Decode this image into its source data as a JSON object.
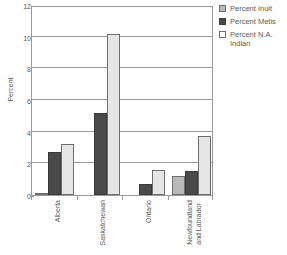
{
  "chart_data": {
    "type": "bar",
    "title": "",
    "xlabel": "",
    "ylabel": "Percent",
    "ylim": [
      0,
      12
    ],
    "yticks": [
      0,
      2,
      4,
      6,
      8,
      10,
      12
    ],
    "ytick_labels": [
      "0",
      "2",
      "4",
      "6",
      "8",
      "10",
      "12"
    ],
    "grid": true,
    "legend_position": "right",
    "categories": [
      "Alberta",
      "Saskatchewan",
      "Ontario",
      "Newfoundland and Labrador"
    ],
    "category_lines": [
      [
        "Alberta"
      ],
      [
        "Saskatchewan"
      ],
      [
        "Ontario"
      ],
      [
        "Newfoundland",
        "and Labrador"
      ]
    ],
    "series": [
      {
        "name": "Percent Inuit",
        "color": "#b9b9b9",
        "values": [
          0.05,
          0,
          0,
          1.2
        ]
      },
      {
        "name": "Percent Metis",
        "color": "#4a4a4a",
        "values": [
          2.7,
          5.2,
          0.7,
          1.5
        ]
      },
      {
        "name": "Percent N.A. Indian",
        "color": "#e6e6e6",
        "values": [
          3.25,
          10.2,
          1.55,
          3.75
        ]
      }
    ]
  },
  "legend": {
    "items": [
      {
        "label": "Percent Inuit"
      },
      {
        "label": "Percent Metis"
      },
      {
        "label": "Percent N.A.\nIndian"
      }
    ]
  },
  "axis": {
    "y_title": "Percent"
  }
}
